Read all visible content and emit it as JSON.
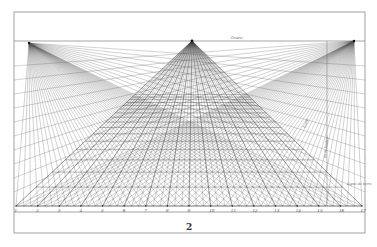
{
  "figure": {
    "number": "2",
    "horizon_label": "Orizon",
    "vertical_label_1": "Ligne",
    "vertical_label_2": "de la hauteur",
    "distance_label": "Ligne de terre",
    "baseline_labels": [
      "1",
      "2",
      "3",
      "4",
      "5",
      "6",
      "7",
      "8",
      "9",
      "10",
      "11",
      "12",
      "13",
      "14",
      "15",
      "16",
      "17"
    ],
    "vanishing_points": [
      "left-distance-point",
      "center-point",
      "right-distance-point"
    ],
    "ink_color": "#333333",
    "paper_color": "#ffffff"
  }
}
